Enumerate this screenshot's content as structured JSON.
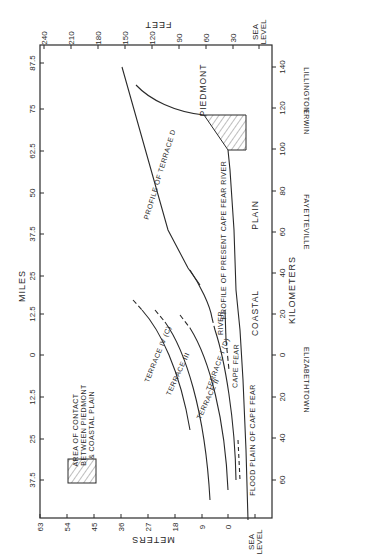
{
  "diagram": {
    "axes": {
      "miles": {
        "title": "MILES",
        "ticks": [
          "87.5",
          "75",
          "62.5",
          "50",
          "37.5",
          "25",
          "12.5",
          "0",
          "12.5",
          "25",
          "37.5"
        ]
      },
      "feet": {
        "title": "FEET",
        "ticks": [
          "240",
          "210",
          "180",
          "150",
          "120",
          "90",
          "60",
          "30"
        ],
        "sea_level": "SEA LEVEL"
      },
      "meters": {
        "title": "METERS",
        "ticks": [
          "63",
          "54",
          "45",
          "36",
          "27",
          "18",
          "9",
          "0"
        ],
        "sea_level": "SEA LEVEL"
      },
      "kilometers": {
        "title": "KILOMETERS",
        "ticks": [
          "140",
          "120",
          "100",
          "80",
          "60",
          "40",
          "20",
          "0",
          "20",
          "40",
          "60"
        ]
      }
    },
    "towns": [
      "LILLINGTON",
      "ERWIN",
      "FAYETTEVILLE",
      "ELIZABETHTOWN"
    ],
    "regions": {
      "piedmont": "PIEDMONT",
      "coastal": "COASTAL",
      "plain": "PLAIN"
    },
    "profiles": {
      "terrace_d": "PROFILE OF TERRACE D",
      "present_river": "PROFILE OF PRESENT CAPE FEAR RIVER",
      "terrace_iv": "TERRACE IV (C)",
      "terrace_iii": "TERRACE III",
      "terrace_ii": "TERRACE II",
      "terrace_i": "TERRACE I (D)",
      "river": "RIVER",
      "cape_fear": "CAPE FEAR",
      "flood_plain": "FLOOD PLAIN OF CAPE FEAR"
    },
    "legend": {
      "line1": "AREA OF CONTACT",
      "line2": "BETWEEN PIEDMONT",
      "line3": "& COASTAL PLAIN"
    }
  }
}
